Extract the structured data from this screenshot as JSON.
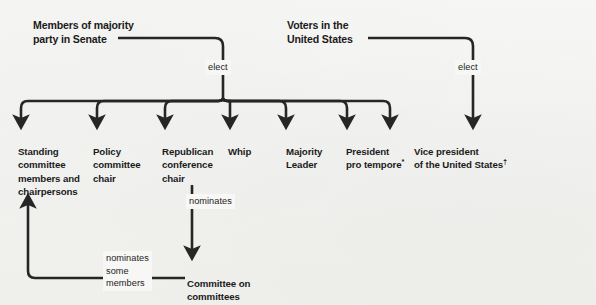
{
  "diagram": {
    "line_color": "#262626",
    "text_color": "#1b1b1b",
    "background_color": "#f2f2f0",
    "sources": [
      {
        "id": "majority-party",
        "text": "Members of majority\nparty in Senate"
      },
      {
        "id": "voters",
        "text": "Voters in the\nUnited States"
      }
    ],
    "edge_labels": {
      "elect_left": "elect",
      "elect_right": "elect",
      "nominates": "nominates",
      "nominates_some_members": "nominates\nsome\nmembers"
    },
    "nodes": [
      {
        "id": "standing-committee",
        "text": "Standing\ncommittee\nmembers and\nchairpersons",
        "footnote": ""
      },
      {
        "id": "policy-committee-chair",
        "text": "Policy\ncommittee\nchair",
        "footnote": ""
      },
      {
        "id": "republican-conference-chair",
        "text": "Republican\nconference\nchair",
        "footnote": ""
      },
      {
        "id": "whip",
        "text": "Whip",
        "footnote": ""
      },
      {
        "id": "majority-leader",
        "text": "Majority\nLeader",
        "footnote": ""
      },
      {
        "id": "president-pro-tempore",
        "text": "President\npro tempore",
        "footnote": "*"
      },
      {
        "id": "vice-president",
        "text": "Vice president\nof the United States",
        "footnote": "†"
      }
    ],
    "committee_node": {
      "id": "committee-on-committees",
      "text": "Committee on\ncommittees"
    }
  }
}
